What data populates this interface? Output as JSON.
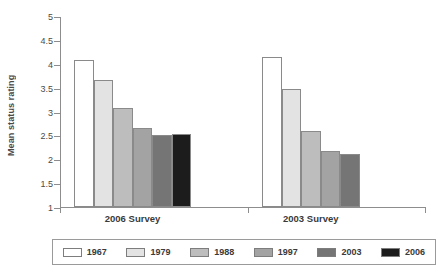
{
  "chart_data": {
    "type": "bar",
    "title": "",
    "subtitle": "",
    "xlabel": "",
    "ylabel": "Mean status rating",
    "ylim": [
      1,
      5
    ],
    "ytick_labels": [
      "1",
      "1.5",
      "2",
      "2.5",
      "3",
      "3.5",
      "4",
      "4.5",
      "5"
    ],
    "ytick_values": [
      1,
      1.5,
      2,
      2.5,
      3,
      3.5,
      4,
      4.5,
      5
    ],
    "grid": false,
    "legend_position": "bottom",
    "categories": [
      "2006 Survey",
      "2003 Survey"
    ],
    "series": [
      {
        "name": "1967",
        "color": "#ffffff",
        "values": [
          4.08,
          4.15
        ]
      },
      {
        "name": "1979",
        "color": "#e3e3e3",
        "values": [
          3.65,
          3.48
        ]
      },
      {
        "name": "1988",
        "color": "#bdbdbd",
        "values": [
          3.08,
          2.6
        ]
      },
      {
        "name": "1997",
        "color": "#a3a3a3",
        "values": [
          2.65,
          2.18
        ]
      },
      {
        "name": "2003",
        "color": "#757575",
        "values": [
          2.5,
          2.12
        ]
      },
      {
        "name": "2006",
        "color": "#1c1c1c",
        "values": [
          2.52,
          null
        ]
      }
    ]
  },
  "axis": {
    "y_title": "Mean status rating"
  },
  "legend": {
    "items": [
      {
        "label": "1967",
        "color": "#ffffff"
      },
      {
        "label": "1979",
        "color": "#e3e3e3"
      },
      {
        "label": "1988",
        "color": "#bdbdbd"
      },
      {
        "label": "1997",
        "color": "#a3a3a3"
      },
      {
        "label": "2003",
        "color": "#757575"
      },
      {
        "label": "2006",
        "color": "#1c1c1c"
      }
    ]
  }
}
